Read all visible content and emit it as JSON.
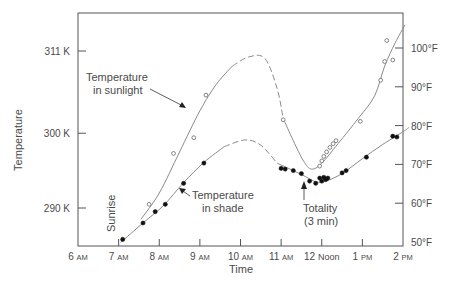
{
  "chart_data": {
    "type": "line",
    "title": "",
    "xlabel": "Time",
    "ylabel": "Temperature",
    "y2label": "",
    "grid": false,
    "legend": "none (direct labels)",
    "x_ticks": [
      {
        "num": "6",
        "suffix": "AM",
        "hour": 6
      },
      {
        "num": "7",
        "suffix": "AM",
        "hour": 7
      },
      {
        "num": "8",
        "suffix": "AM",
        "hour": 8
      },
      {
        "num": "9",
        "suffix": "AM",
        "hour": 9
      },
      {
        "num": "10",
        "suffix": "AM",
        "hour": 10
      },
      {
        "num": "11",
        "suffix": "AM",
        "hour": 11
      },
      {
        "num": "12",
        "suffix": "Noon",
        "hour": 12
      },
      {
        "num": "1",
        "suffix": "PM",
        "hour": 13
      },
      {
        "num": "2",
        "suffix": "PM",
        "hour": 14
      }
    ],
    "xlim": [
      6,
      14
    ],
    "y_left_ticks": [
      {
        "label": "311 K",
        "value": 311
      },
      {
        "label": "300 K",
        "value": 300
      },
      {
        "label": "290 K",
        "value": 290
      }
    ],
    "y_right_ticks": [
      {
        "label": "100°F",
        "value": 100
      },
      {
        "label": "90°F",
        "value": 90
      },
      {
        "label": "80°F",
        "value": 80
      },
      {
        "label": "70°F",
        "value": 70
      },
      {
        "label": "60°F",
        "value": 60
      },
      {
        "label": "50°F",
        "value": 50
      }
    ],
    "ylim_K": [
      284.5,
      316.5
    ],
    "series": [
      {
        "name": "Temperature in sunlight",
        "marker": "open-circle",
        "points": [
          {
            "t": 7.75,
            "K": 290.5
          },
          {
            "t": 8.35,
            "K": 297.3
          },
          {
            "t": 8.85,
            "K": 299.4
          },
          {
            "t": 9.15,
            "K": 305.1
          },
          {
            "t": 11.05,
            "K": 301.8
          },
          {
            "t": 11.95,
            "K": 295.6
          },
          {
            "t": 12.0,
            "K": 296.3
          },
          {
            "t": 12.05,
            "K": 296.9
          },
          {
            "t": 12.12,
            "K": 297.5
          },
          {
            "t": 12.2,
            "K": 298.1
          },
          {
            "t": 12.28,
            "K": 298.6
          },
          {
            "t": 12.35,
            "K": 299.0
          },
          {
            "t": 12.95,
            "K": 301.6
          },
          {
            "t": 13.45,
            "K": 307.1
          },
          {
            "t": 13.55,
            "K": 309.6
          },
          {
            "t": 13.75,
            "K": 309.8
          },
          {
            "t": 13.6,
            "K": 312.4
          }
        ],
        "curve_solid_1": [
          [
            7.55,
            288.5
          ],
          [
            8.0,
            292.0
          ],
          [
            8.5,
            297.5
          ],
          [
            9.0,
            303.0
          ],
          [
            9.4,
            306.5
          ],
          [
            9.8,
            309.0
          ]
        ],
        "curve_dashed": [
          [
            9.8,
            309.0
          ],
          [
            10.2,
            310.2
          ],
          [
            10.6,
            310.0
          ],
          [
            10.9,
            306.0
          ],
          [
            11.05,
            302.0
          ]
        ],
        "curve_solid_2": [
          [
            11.05,
            302.0
          ],
          [
            11.3,
            299.0
          ],
          [
            11.55,
            296.3
          ],
          [
            11.75,
            295.2
          ],
          [
            12.0,
            296.0
          ],
          [
            12.4,
            298.6
          ],
          [
            12.9,
            302.0
          ],
          [
            13.3,
            305.0
          ],
          [
            13.55,
            309.0
          ],
          [
            13.8,
            312.0
          ],
          [
            14.05,
            314.5
          ]
        ]
      },
      {
        "name": "Temperature in shade",
        "marker": "filled-circle",
        "points": [
          {
            "t": 7.1,
            "K": 285.8
          },
          {
            "t": 7.6,
            "K": 288.0
          },
          {
            "t": 7.9,
            "K": 289.5
          },
          {
            "t": 8.15,
            "K": 290.5
          },
          {
            "t": 8.6,
            "K": 293.3
          },
          {
            "t": 9.1,
            "K": 296.0
          },
          {
            "t": 11.0,
            "K": 295.3
          },
          {
            "t": 11.1,
            "K": 295.2
          },
          {
            "t": 11.3,
            "K": 295.0
          },
          {
            "t": 11.5,
            "K": 294.6
          },
          {
            "t": 11.7,
            "K": 293.6
          },
          {
            "t": 11.85,
            "K": 293.3
          },
          {
            "t": 11.95,
            "K": 294.0
          },
          {
            "t": 12.0,
            "K": 293.6
          },
          {
            "t": 12.05,
            "K": 294.1
          },
          {
            "t": 12.1,
            "K": 293.8
          },
          {
            "t": 12.15,
            "K": 294.0
          },
          {
            "t": 12.5,
            "K": 294.7
          },
          {
            "t": 12.6,
            "K": 295.0
          },
          {
            "t": 13.1,
            "K": 296.8
          },
          {
            "t": 13.75,
            "K": 299.6
          },
          {
            "t": 13.85,
            "K": 299.5
          }
        ],
        "curve_solid_1": [
          [
            7.05,
            285.4
          ],
          [
            7.6,
            288.0
          ],
          [
            8.1,
            290.3
          ],
          [
            8.6,
            293.4
          ],
          [
            9.1,
            296.1
          ],
          [
            9.6,
            298.2
          ]
        ],
        "curve_dashed": [
          [
            9.6,
            298.2
          ],
          [
            10.1,
            299.1
          ],
          [
            10.5,
            298.4
          ],
          [
            10.9,
            296.0
          ]
        ],
        "curve_solid_2": [
          [
            10.9,
            296.0
          ],
          [
            11.3,
            295.0
          ],
          [
            11.6,
            294.2
          ],
          [
            11.85,
            293.5
          ],
          [
            12.1,
            293.6
          ],
          [
            12.5,
            294.6
          ],
          [
            13.0,
            296.6
          ],
          [
            13.5,
            298.5
          ],
          [
            14.0,
            300.2
          ],
          [
            14.15,
            300.8
          ]
        ]
      }
    ],
    "annotations": [
      {
        "id": "sunlight",
        "lines": [
          "Temperature",
          "in sunlight"
        ]
      },
      {
        "id": "shade",
        "lines": [
          "Temperature",
          "in shade"
        ]
      },
      {
        "id": "totality",
        "lines": [
          "Totality",
          "(3 min)"
        ]
      },
      {
        "id": "sunrise",
        "lines": [
          "Sunrise"
        ]
      }
    ]
  }
}
